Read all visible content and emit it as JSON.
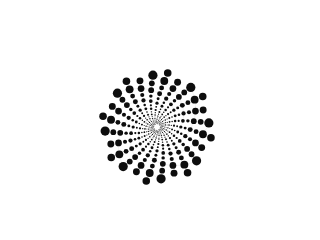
{
  "artwork": {
    "title": "Spiral Dot Vortex",
    "type": "generative-spiral-dot-pattern",
    "canvas": {
      "width": 266,
      "height": 213,
      "background_color": "#ffffff"
    },
    "palette": {
      "dot_color": "#0d0d0d",
      "trail_color": "#e2e2e2",
      "background_color": "#ffffff"
    },
    "spiral": {
      "center_x": 157,
      "center_y": 127,
      "arm_count": 8,
      "dots_per_arm": 26,
      "growth_factor": 1.118,
      "angle_step_deg": 13.5,
      "start_radius": 3.2,
      "min_dot_radius": 0.35,
      "max_dot_radius": 4.6,
      "rotation_offset_deg": 198,
      "trail_opacity": 0.85,
      "direction": "counterclockwise-outward"
    },
    "description": "Abstract halftone vortex: eight logarithmic spiral arms of black dots radiate from a center point at the lower middle-right, each dot growing larger as the arm sweeps outward toward the upper left, with faint grey spiral trails linking the dots."
  }
}
